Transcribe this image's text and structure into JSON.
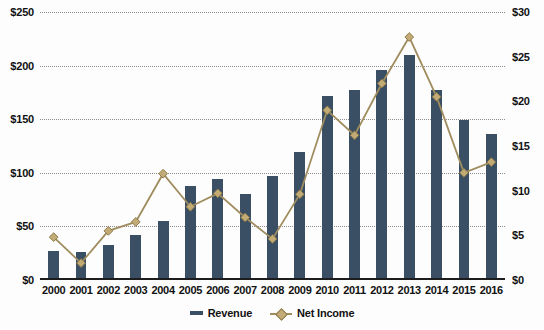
{
  "chart_data": {
    "type": "bar",
    "title": "",
    "subtitle": "",
    "xlabel": "",
    "ylabel": "",
    "categories": [
      "2000",
      "2001",
      "2002",
      "2003",
      "2004",
      "2005",
      "2006",
      "2007",
      "2008",
      "2009",
      "2010",
      "2011",
      "2012",
      "2013",
      "2014",
      "2015",
      "2016"
    ],
    "series": [
      {
        "name": "Revenue",
        "type": "bar",
        "axis": "left",
        "color": "#3a4f63",
        "values": [
          27,
          26,
          33,
          42,
          55,
          88,
          94,
          80,
          97,
          119,
          172,
          177,
          196,
          210,
          177,
          149,
          136
        ]
      },
      {
        "name": "Net Income",
        "type": "line",
        "axis": "right",
        "color": "#a08d5f",
        "marker_color": "#c2ab74",
        "values": [
          4.8,
          1.9,
          5.5,
          6.5,
          11.9,
          8.2,
          9.7,
          7.0,
          4.6,
          9.6,
          19.0,
          16.2,
          22.0,
          27.2,
          20.5,
          12.0,
          13.2
        ]
      }
    ],
    "left_axis": {
      "ticks": [
        "$0",
        "$50",
        "$100",
        "$150",
        "$200",
        "$250"
      ],
      "tick_values": [
        0,
        50,
        100,
        150,
        200,
        250
      ],
      "min": 0,
      "max": 250
    },
    "right_axis": {
      "ticks": [
        "$0",
        "$5",
        "$10",
        "$15",
        "$20",
        "$25",
        "$30"
      ],
      "tick_values": [
        0,
        5,
        10,
        15,
        20,
        25,
        30
      ],
      "min": 0,
      "max": 30
    },
    "grid": true,
    "grid_style": "dotted",
    "legend_position": "bottom",
    "legend": [
      {
        "label": "Revenue",
        "marker": "bar-swatch",
        "color": "#3a4f63"
      },
      {
        "label": "Net Income",
        "marker": "line-diamond",
        "color": "#a08d5f"
      }
    ]
  },
  "colors": {
    "bar": "#3a4f63",
    "line": "#a08d5f",
    "marker_fill": "#c2ab74",
    "marker_stroke": "#8a7748",
    "grid": "#8d8d8d",
    "axis": "#1d1d1d",
    "background": "#fdfdfd",
    "text": "#111111"
  }
}
